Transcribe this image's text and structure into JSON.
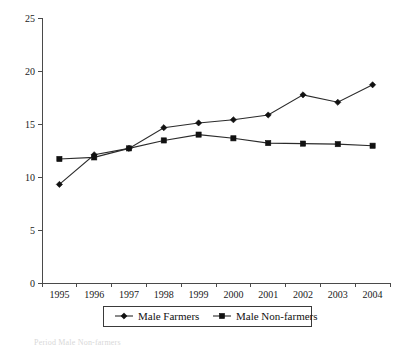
{
  "chart_data": {
    "type": "line",
    "title": "",
    "subtitle": "",
    "xlabel": "",
    "ylabel": "",
    "categories": [
      "1995",
      "1996",
      "1997",
      "1998",
      "1999",
      "2000",
      "2001",
      "2002",
      "2003",
      "2004"
    ],
    "series": [
      {
        "name": "Male Farmers",
        "marker": "diamond",
        "color": "#111111",
        "values": [
          9.3,
          12.1,
          12.7,
          14.65,
          15.1,
          15.4,
          15.85,
          17.75,
          17.05,
          18.7
        ]
      },
      {
        "name": "Male Non-farmers",
        "marker": "square",
        "color": "#111111",
        "values": [
          11.7,
          11.85,
          12.7,
          13.45,
          14.0,
          13.65,
          13.2,
          13.15,
          13.1,
          12.95
        ]
      }
    ],
    "ylim": [
      0,
      25
    ],
    "yticks": [
      0,
      5,
      10,
      15,
      20,
      25
    ],
    "ytick_labels": [
      "0",
      "5",
      "10",
      "15",
      "20",
      "25"
    ],
    "grid": false,
    "legend_position": "bottom",
    "legend_entries": [
      "Male Farmers",
      "Male Non-farmers"
    ]
  },
  "caption": {
    "cut_text": "Period  Male  Non-farmers"
  }
}
